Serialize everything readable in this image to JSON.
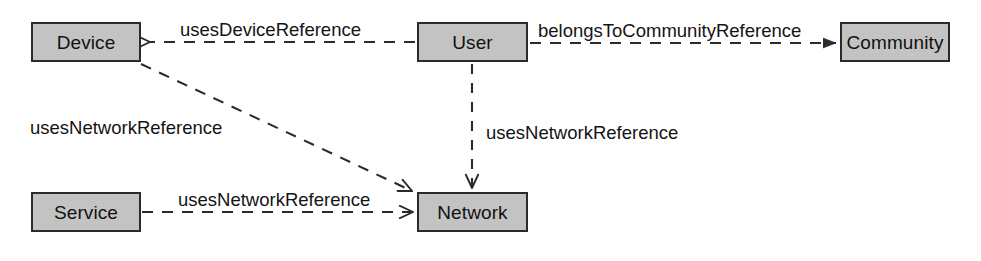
{
  "diagram": {
    "type": "uml-dependency-diagram",
    "background_color": "#ffffff",
    "node_fill_color": "#c3c3c3",
    "node_border_color": "#2b2b2b",
    "edge_color": "#2b2b2b",
    "text_color": "#141414",
    "nodes": [
      {
        "id": "device",
        "label": "Device",
        "x": 31,
        "y": 22,
        "width": 110,
        "height": 40
      },
      {
        "id": "user",
        "label": "User",
        "x": 417,
        "y": 22,
        "width": 111,
        "height": 40
      },
      {
        "id": "community",
        "label": "Community",
        "x": 840,
        "y": 22,
        "width": 110,
        "height": 40
      },
      {
        "id": "service",
        "label": "Service",
        "x": 31,
        "y": 192,
        "width": 110,
        "height": 40
      },
      {
        "id": "network",
        "label": "Network",
        "x": 417,
        "y": 192,
        "width": 111,
        "height": 40
      }
    ],
    "edges": [
      {
        "id": "user-uses-device",
        "label": "usesDeviceReference",
        "source": "user",
        "target": "device",
        "style": "dashed",
        "arrowhead": "open",
        "direction": "left"
      },
      {
        "id": "user-belongs-to-community",
        "label": "belongsToCommunityReference",
        "source": "user",
        "target": "community",
        "style": "dashed",
        "arrowhead": "filled",
        "direction": "right"
      },
      {
        "id": "device-uses-network",
        "label": "usesNetworkReference",
        "source": "device",
        "target": "network",
        "style": "dashed",
        "arrowhead": "open",
        "direction": "diagonal-down-right"
      },
      {
        "id": "service-uses-network",
        "label": "usesNetworkReference",
        "source": "service",
        "target": "network",
        "style": "dashed",
        "arrowhead": "open",
        "direction": "right"
      },
      {
        "id": "user-uses-network",
        "label": "usesNetworkReference",
        "source": "user",
        "target": "network",
        "style": "dashed",
        "arrowhead": "open",
        "direction": "down"
      }
    ],
    "labels": {
      "uses_device_reference": "usesDeviceReference",
      "belongs_to_community_reference": "belongsToCommunityReference",
      "uses_network_reference_device": "usesNetworkReference",
      "uses_network_reference_service": "usesNetworkReference",
      "uses_network_reference_user": "usesNetworkReference"
    }
  }
}
